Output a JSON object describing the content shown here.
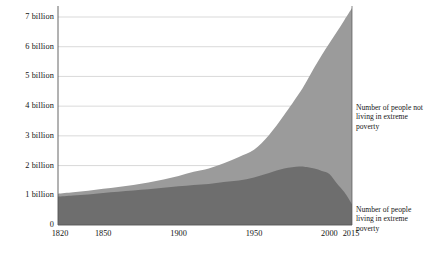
{
  "chart_data": {
    "type": "area",
    "stacked": true,
    "title": "",
    "subtitle": "",
    "xlabel": "",
    "ylabel": "",
    "xlim": [
      1820,
      2015
    ],
    "ylim": [
      0,
      7.5
    ],
    "y_unit": "billion",
    "grid": true,
    "legend_position": "right-inline",
    "y_ticks": [
      {
        "value": 0,
        "label": "0"
      },
      {
        "value": 1,
        "label": "1 billion"
      },
      {
        "value": 2,
        "label": "2 billion"
      },
      {
        "value": 3,
        "label": "3 billion"
      },
      {
        "value": 4,
        "label": "4 billion"
      },
      {
        "value": 5,
        "label": "5 billion"
      },
      {
        "value": 6,
        "label": "6 billion"
      },
      {
        "value": 7,
        "label": "7 billion"
      }
    ],
    "x_ticks": [
      {
        "value": 1820,
        "label": "1820"
      },
      {
        "value": 1850,
        "label": "1850"
      },
      {
        "value": 1900,
        "label": "1900"
      },
      {
        "value": 1950,
        "label": "1950"
      },
      {
        "value": 2000,
        "label": "2000"
      },
      {
        "value": 2015,
        "label": "2015"
      }
    ],
    "annotations": [
      {
        "id": "upper",
        "text": "Number of people not living in extreme poverty"
      },
      {
        "id": "lower",
        "text": "Number of people living in extreme poverty"
      }
    ],
    "colors": {
      "series_poverty": "#6e6e6e",
      "series_not_poverty": "#9b9b9b",
      "gridline": "#cfcfcf",
      "axis": "#555555",
      "background": "#ffffff",
      "text": "#141414"
    },
    "x": [
      1820,
      1830,
      1840,
      1850,
      1860,
      1870,
      1880,
      1890,
      1900,
      1910,
      1920,
      1930,
      1940,
      1950,
      1960,
      1970,
      1980,
      1985,
      1990,
      1995,
      2000,
      2005,
      2010,
      2015
    ],
    "series": [
      {
        "name": "Number of people living in extreme poverty",
        "color": "#6e6e6e",
        "values": [
          0.95,
          0.99,
          1.03,
          1.08,
          1.12,
          1.16,
          1.2,
          1.25,
          1.3,
          1.35,
          1.38,
          1.45,
          1.5,
          1.6,
          1.75,
          1.9,
          1.97,
          1.95,
          1.9,
          1.82,
          1.72,
          1.4,
          1.1,
          0.7
        ]
      },
      {
        "name": "Number of people not living in extreme poverty",
        "color": "#9b9b9b",
        "values": [
          0.1,
          0.11,
          0.12,
          0.14,
          0.16,
          0.19,
          0.23,
          0.28,
          0.35,
          0.44,
          0.52,
          0.63,
          0.79,
          0.93,
          1.28,
          1.8,
          2.46,
          2.9,
          3.4,
          3.9,
          4.4,
          5.1,
          5.8,
          6.6
        ]
      }
    ],
    "totals": [
      1.05,
      1.1,
      1.15,
      1.22,
      1.28,
      1.35,
      1.43,
      1.53,
      1.65,
      1.79,
      1.9,
      2.08,
      2.29,
      2.53,
      3.03,
      3.7,
      4.43,
      4.85,
      5.3,
      5.72,
      6.12,
      6.5,
      6.9,
      7.3
    ]
  }
}
